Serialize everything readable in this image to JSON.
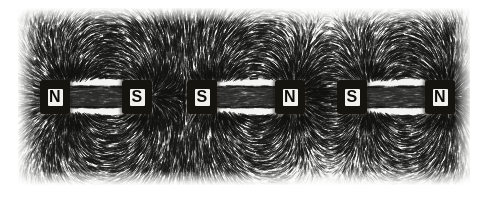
{
  "figure": {
    "title": "Iron filings pattern around three bar magnets",
    "background_color": "#f4f4f2",
    "filing_color": "#1a1a1a",
    "magnet_color": "#16140f",
    "label_color": "#0d0c09",
    "plate": {
      "x": 18,
      "y": 8,
      "width": 452,
      "height": 177
    }
  },
  "magnets": [
    {
      "id": "magnet-1",
      "x": 40,
      "y": 80,
      "width": 112,
      "poles": [
        {
          "position": "left",
          "label": "N"
        },
        {
          "position": "right",
          "label": "S"
        }
      ]
    },
    {
      "id": "magnet-2",
      "x": 187,
      "y": 80,
      "width": 118,
      "poles": [
        {
          "position": "left",
          "label": "S"
        },
        {
          "position": "right",
          "label": "N"
        }
      ]
    },
    {
      "id": "magnet-3",
      "x": 337,
      "y": 80,
      "width": 118,
      "poles": [
        {
          "position": "left",
          "label": "S"
        },
        {
          "position": "right",
          "label": "N"
        }
      ]
    }
  ],
  "poles_sequence": [
    "N",
    "S",
    "S",
    "N",
    "S",
    "N"
  ],
  "chart_data": {
    "type": "scatter",
    "title": "Iron filings pattern around three bar magnets",
    "xlabel": "",
    "ylabel": "",
    "poles": [
      {
        "name": "N1",
        "x": 73,
        "y": 97,
        "polarity": "N",
        "magnet": 1
      },
      {
        "name": "S1",
        "x": 150,
        "y": 97,
        "polarity": "S",
        "magnet": 1
      },
      {
        "name": "S2",
        "x": 219,
        "y": 97,
        "polarity": "S",
        "magnet": 2
      },
      {
        "name": "N2",
        "x": 293,
        "y": 97,
        "polarity": "N",
        "magnet": 2
      },
      {
        "name": "S3",
        "x": 369,
        "y": 97,
        "polarity": "S",
        "magnet": 3
      },
      {
        "name": "N3",
        "x": 446,
        "y": 97,
        "polarity": "N",
        "magnet": 3
      }
    ],
    "xlim": [
      18,
      470
    ],
    "ylim": [
      8,
      185
    ],
    "grid": false,
    "legend": "none"
  }
}
